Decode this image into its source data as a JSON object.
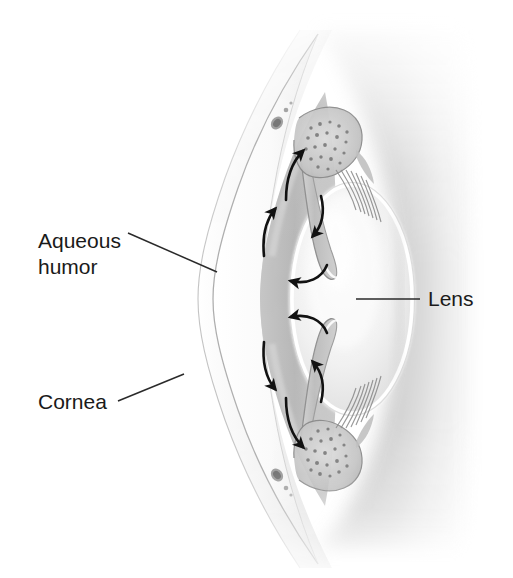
{
  "figure": {
    "view": "sagittal cross-section of the anterior segment of the human eye",
    "background_color": "#ffffff",
    "width": 513,
    "height": 578
  },
  "labels": [
    {
      "id": "aqueous-humor",
      "line1": "Aqueous",
      "line2": "humor",
      "text": "Aqueous humor",
      "text_x": 38,
      "text_y": 248,
      "leader": {
        "x1": 128,
        "y1": 233,
        "x2": 217,
        "y2": 272
      }
    },
    {
      "id": "cornea",
      "line1": "Cornea",
      "line2": "",
      "text": "Cornea",
      "text_x": 38,
      "text_y": 409,
      "leader": {
        "x1": 118,
        "y1": 401,
        "x2": 184,
        "y2": 374
      }
    },
    {
      "id": "lens",
      "line1": "Lens",
      "line2": "",
      "text": "Lens",
      "text_x": 428,
      "text_y": 306,
      "leader": {
        "x1": 356,
        "y1": 299,
        "x2": 420,
        "y2": 299
      }
    }
  ],
  "structures": [
    {
      "id": "cornea-layer",
      "name": "Cornea",
      "tone": "#fdfdfd"
    },
    {
      "id": "anterior-chamber",
      "name": "Anterior chamber (aqueous humor)",
      "tone": "#b9b9b9"
    },
    {
      "id": "iris-upper",
      "name": "Iris (upper leaf)",
      "tone": "#c8c8c8"
    },
    {
      "id": "iris-lower",
      "name": "Iris (lower leaf)",
      "tone": "#c8c8c8"
    },
    {
      "id": "lens-body",
      "name": "Lens",
      "tone": "#f4f4f4"
    },
    {
      "id": "lens-capsule",
      "name": "Lens capsule",
      "tone": "#ffffff"
    },
    {
      "id": "ciliary-body-upper",
      "name": "Ciliary body (upper)",
      "tone": "#d0d0d0"
    },
    {
      "id": "ciliary-body-lower",
      "name": "Ciliary body (lower)",
      "tone": "#d0d0d0"
    },
    {
      "id": "zonule-upper",
      "name": "Zonular fibers (upper)",
      "tone": "#9a9a9a"
    },
    {
      "id": "zonule-lower",
      "name": "Zonular fibers (lower)",
      "tone": "#9a9a9a"
    },
    {
      "id": "schlemm-canal-upper",
      "name": "Schlemm's canal (upper)",
      "tone": "#8d8d8d"
    },
    {
      "id": "schlemm-canal-lower",
      "name": "Schlemm's canal (lower)",
      "tone": "#8d8d8d"
    },
    {
      "id": "sclera-limbus",
      "name": "Sclera / limbus",
      "tone": "#e6e6e6"
    },
    {
      "id": "vitreous-shadow",
      "name": "Vitreous body shading",
      "tone": "#cfcfcf"
    }
  ],
  "flow_arrows": [
    {
      "id": "arrow-upper-chamber-outer",
      "direction": "up-right",
      "meaning": "aqueous flowing up through anterior chamber toward the angle"
    },
    {
      "id": "arrow-upper-chamber-inner",
      "direction": "up-right",
      "meaning": "aqueous flowing up along the iris face"
    },
    {
      "id": "arrow-upper-angle-down",
      "direction": "down-right",
      "meaning": "aqueous entering the iridocorneal angle"
    },
    {
      "id": "arrow-upper-pupil-left",
      "direction": "left",
      "meaning": "aqueous passing through the pupil into anterior chamber"
    },
    {
      "id": "arrow-lower-chamber-outer",
      "direction": "down-right",
      "meaning": "aqueous flowing down through anterior chamber toward the angle"
    },
    {
      "id": "arrow-lower-chamber-inner",
      "direction": "down-right",
      "meaning": "aqueous flowing down along the iris face"
    },
    {
      "id": "arrow-lower-angle-up",
      "direction": "up-right",
      "meaning": "aqueous entering the iridocorneal angle"
    },
    {
      "id": "arrow-lower-pupil-left",
      "direction": "left",
      "meaning": "aqueous passing through the pupil into anterior chamber"
    }
  ],
  "colors": {
    "ink": "#1a1a1a",
    "leader_line": "#2a2a2a",
    "arrow": "#111111",
    "page": "#ffffff"
  }
}
